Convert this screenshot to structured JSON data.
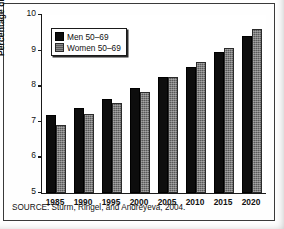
{
  "figure": {
    "source_note": "SOURCE: Sturm, Ringel, and Andreyeva, 2004."
  },
  "legend": {
    "position": "top-left-inside",
    "entries": [
      {
        "label": "Men 50–69",
        "swatch": "black-square-icon",
        "color": "#0d0d0d"
      },
      {
        "label": "Women 50–69",
        "swatch": "gray-square-icon",
        "color": "#595959"
      }
    ]
  },
  "chart_data": {
    "type": "bar",
    "title": "",
    "xlabel": "",
    "ylabel": "Percentage disabled",
    "ylim": [
      5,
      10
    ],
    "yticks": [
      5,
      6,
      7,
      8,
      9,
      10
    ],
    "ytick_labels": [
      "5",
      "6",
      "7",
      "8",
      "9",
      "10"
    ],
    "grid": false,
    "legend_position": "upper left",
    "categories": [
      "1985",
      "1990",
      "1995",
      "2000",
      "2005",
      "2010",
      "2015",
      "2020"
    ],
    "series": [
      {
        "name": "Men 50–69",
        "color": "#0d0d0d",
        "values": [
          7.2,
          7.4,
          7.63,
          7.95,
          8.25,
          8.55,
          8.97,
          9.4
        ]
      },
      {
        "name": "Women 50–69",
        "color": "#595959",
        "values": [
          6.9,
          7.22,
          7.52,
          7.85,
          8.26,
          8.67,
          9.08,
          9.6
        ]
      }
    ]
  }
}
